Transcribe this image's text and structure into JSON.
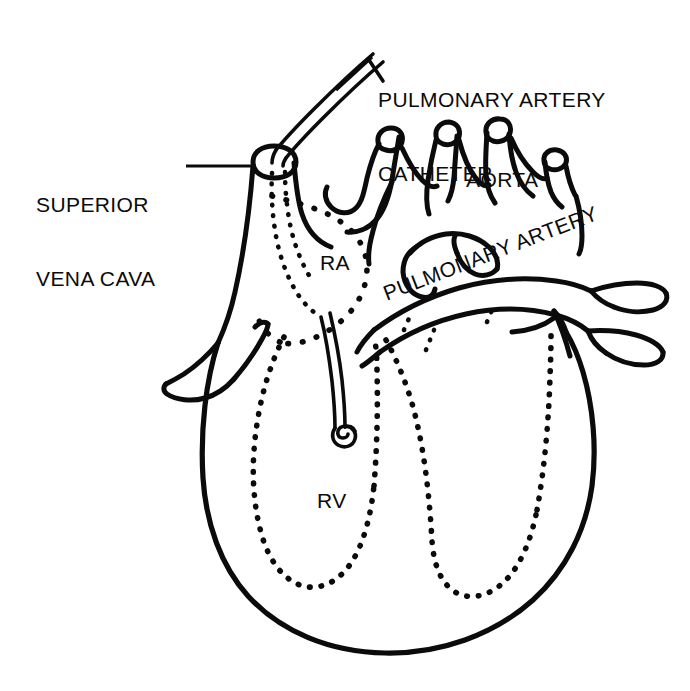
{
  "figure": {
    "type": "anatomical-line-drawing",
    "style": "black ink line art on white background",
    "background_color": "#ffffff",
    "ink_color": "#0b0b0b",
    "width_px": 690,
    "height_px": 691
  },
  "labels": {
    "pa_catheter": {
      "line1": "PULMONARY ARTERY",
      "line2": "CATHETER",
      "leader": "diagonal double line to catheter tubing"
    },
    "superior_vena_cava": {
      "line1": "SUPERIOR",
      "line2": "VENA CAVA",
      "leader": "horizontal line to vessel"
    },
    "aorta": {
      "text": "AORTA"
    },
    "pulmonary_artery": {
      "text": "PULMONARY ARTERY"
    },
    "right_atrium": {
      "text": "RA"
    },
    "right_ventricle": {
      "text": "RV"
    }
  },
  "structures": [
    {
      "name": "superior-vena-cava",
      "rendering": "solid outline tube"
    },
    {
      "name": "inferior-vena-cava",
      "rendering": "solid outline tube with cut end"
    },
    {
      "name": "aortic-arch",
      "rendering": "solid outline with three branch vessels"
    },
    {
      "name": "pulmonary-artery",
      "rendering": "solid outline branching tubes"
    },
    {
      "name": "right-atrium",
      "rendering": "dotted outline chamber"
    },
    {
      "name": "right-ventricle",
      "rendering": "dotted outline chamber"
    },
    {
      "name": "left-ventricle",
      "rendering": "dotted outline chamber"
    },
    {
      "name": "heart-silhouette",
      "rendering": "solid heavy outline"
    },
    {
      "name": "catheter",
      "rendering": "double thin line, dotted within vena cava, tip coiled in right ventricle"
    }
  ]
}
